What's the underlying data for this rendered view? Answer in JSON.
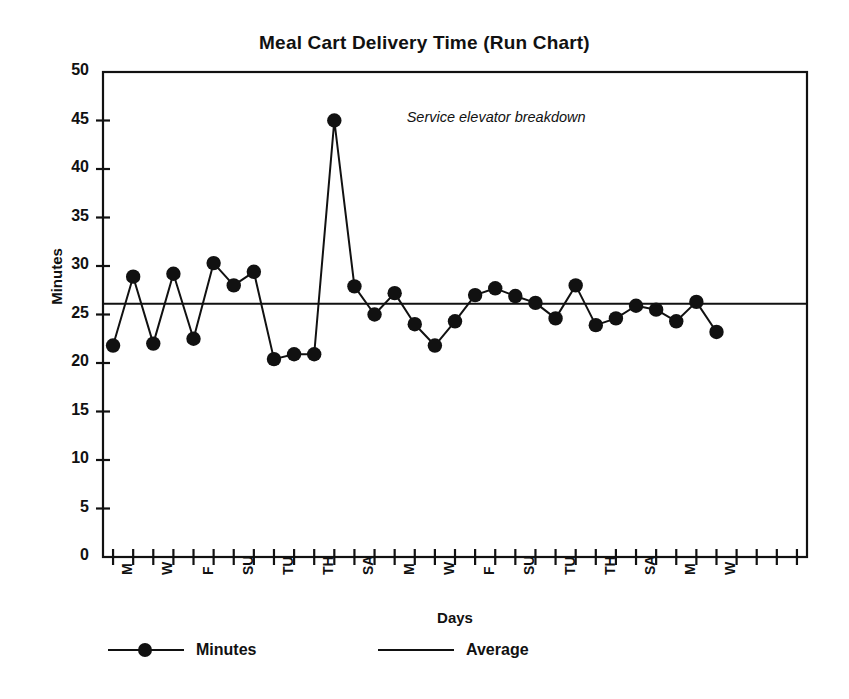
{
  "chart_data": {
    "type": "line",
    "title": "Meal Cart Delivery Time (Run Chart)",
    "xlabel": "Days",
    "ylabel": "Minutes",
    "ylim": [
      0,
      50
    ],
    "ytick_step": 5,
    "yticks": [
      0,
      5,
      10,
      15,
      20,
      25,
      30,
      35,
      40,
      45,
      50
    ],
    "ytick_labels": [
      "0",
      "5",
      "10",
      "15",
      "20",
      "25",
      "30",
      "35",
      "40",
      "45",
      "50"
    ],
    "grid": false,
    "legend_position": "below-axes-left",
    "legend": [
      {
        "name": "Minutes",
        "style": "line-with-round-markers",
        "color": "#111111"
      },
      {
        "name": "Average",
        "style": "plain-line",
        "color": "#111111"
      }
    ],
    "annotations": [
      {
        "text": "Service elevator breakdown",
        "style": "italic",
        "points_to_index": 14,
        "points_to_value": 45
      }
    ],
    "x_tick_count": 35,
    "xtick_labels": [
      "M",
      "",
      "W",
      "",
      "F",
      "",
      "SU",
      "",
      "TU",
      "",
      "TH",
      "",
      "SA",
      "",
      "M",
      "",
      "W",
      "",
      "F",
      "",
      "SU",
      "",
      "TU",
      "",
      "TH",
      "",
      "SA",
      "",
      "M",
      "",
      "W",
      "",
      "",
      "",
      ""
    ],
    "series": [
      {
        "name": "Minutes",
        "marker": "circle",
        "values": [
          21.8,
          28.9,
          22.0,
          29.2,
          22.5,
          30.3,
          28.0,
          29.4,
          20.4,
          20.9,
          20.9,
          45.0,
          27.9,
          25.0,
          27.2,
          24.0,
          21.8,
          24.3,
          27.0,
          27.7,
          26.9,
          26.2,
          24.6,
          28.0,
          23.9,
          24.6,
          25.9,
          25.5,
          24.3,
          26.3,
          23.2
        ]
      },
      {
        "name": "Average",
        "type": "reference-line",
        "value": 26.1
      }
    ]
  },
  "colors": {
    "ink": "#111111",
    "background": "#ffffff",
    "axis": "#111111",
    "series": "#111111"
  }
}
